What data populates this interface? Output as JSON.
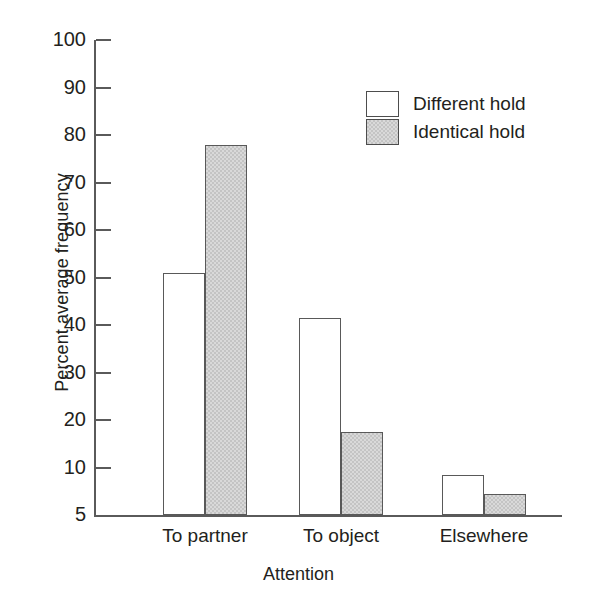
{
  "chart_data": {
    "type": "bar",
    "title": "",
    "xlabel": "Attention",
    "ylabel": "Percent average frequency",
    "categories": [
      "To partner",
      "To object",
      "Elsewhere"
    ],
    "series": [
      {
        "name": "Different hold",
        "fill": "white",
        "values": [
          51,
          41.5,
          8.5
        ]
      },
      {
        "name": "Identical hold",
        "fill": "gray",
        "values": [
          78,
          17.5,
          4.5
        ]
      }
    ],
    "ylim": [
      5,
      100
    ],
    "ytick_labels": [
      "100",
      "90",
      "80",
      "70",
      "60",
      "50",
      "40",
      "30",
      "20",
      "10",
      "5"
    ],
    "ytick_values": [
      100,
      90,
      80,
      70,
      60,
      50,
      40,
      30,
      20,
      10,
      5
    ],
    "grid": false,
    "legend_position": "top-right",
    "axis_color": "#5a5a5a",
    "bar_edge_color": "#595959",
    "fill_white": "#ffffff",
    "fill_gray": "#d9d9d9",
    "text_color": "#231f20"
  }
}
